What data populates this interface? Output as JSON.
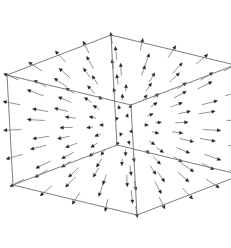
{
  "chart_data": {
    "type": "vector_field_3d",
    "title": "",
    "field": "F(x,y,z) = (x, y, z)",
    "grid": {
      "x": [
        -1,
        -0.5,
        0,
        0.5,
        1
      ],
      "y": [
        -1,
        -0.5,
        0,
        0.5,
        1
      ],
      "z": [
        -1,
        -0.5,
        0,
        0.5,
        1
      ]
    },
    "box": true,
    "axes_labels": {
      "x": "",
      "y": "",
      "z": ""
    },
    "ticks": false,
    "colors": {
      "edge": "#6e6e6e",
      "shaft": "#777777",
      "head": "#222222",
      "background": "#ffffff"
    },
    "projection": {
      "origin": [
        124,
        125
      ],
      "ex": [
        -52,
        20
      ],
      "ey": [
        62,
        15
      ],
      "ez": [
        -3,
        -55
      ]
    },
    "box_corners_screen": {
      "back_top": [
        96,
        17
      ],
      "right_top": [
        220,
        46
      ],
      "left_top": [
        16,
        81
      ],
      "front_top": [
        160,
        130
      ],
      "bottom_left": [
        33,
        182
      ],
      "bottom_front": [
        154,
        234
      ],
      "right_bottom": [
        209,
        145
      ]
    }
  }
}
